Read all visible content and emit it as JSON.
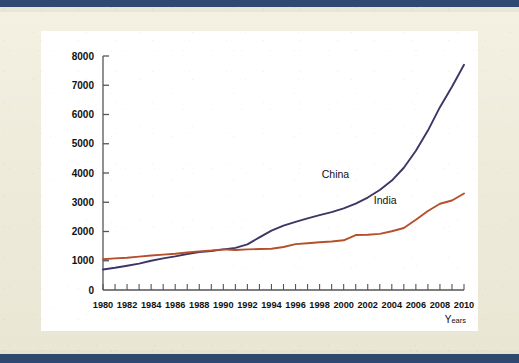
{
  "page": {
    "background_color": "#efebdb",
    "band_color": "#2e4a72",
    "card_color": "#ffffff"
  },
  "chart_data": {
    "type": "line",
    "title": "",
    "subtitle": "",
    "xlabel": "Years",
    "ylabel": "",
    "xlim": [
      1980,
      2010
    ],
    "ylim": [
      0,
      8000
    ],
    "grid": false,
    "legend": "inline-labels",
    "y_ticks": [
      0,
      1000,
      2000,
      3000,
      4000,
      5000,
      6000,
      7000,
      8000
    ],
    "y_tick_labels": [
      "0",
      "1000",
      "2000",
      "3000",
      "4000",
      "5000",
      "6000",
      "7000",
      "8000"
    ],
    "x_ticks": [
      1980,
      1981,
      1982,
      1983,
      1984,
      1985,
      1986,
      1987,
      1988,
      1989,
      1990,
      1991,
      1992,
      1993,
      1994,
      1995,
      1996,
      1997,
      1998,
      1999,
      2000,
      2001,
      2002,
      2003,
      2004,
      2005,
      2006,
      2007,
      2008,
      2009,
      2010
    ],
    "x_tick_labels": [
      "1980",
      "1982",
      "1984",
      "1986",
      "1988",
      "1990",
      "1992",
      "1994",
      "1996",
      "1998",
      "2000",
      "2002",
      "2004",
      "2006",
      "2008",
      "2010"
    ],
    "x_tick_label_step": 2,
    "x": [
      1980,
      1981,
      1982,
      1983,
      1984,
      1985,
      1986,
      1987,
      1988,
      1989,
      1990,
      1991,
      1992,
      1993,
      1994,
      1995,
      1996,
      1997,
      1998,
      1999,
      2000,
      2001,
      2002,
      2003,
      2004,
      2005,
      2006,
      2007,
      2008,
      2009,
      2010
    ],
    "series": [
      {
        "name": "China",
        "color": "#3e3564",
        "label_position": "above-line",
        "values": [
          700,
          760,
          830,
          900,
          1000,
          1080,
          1150,
          1230,
          1300,
          1330,
          1390,
          1440,
          1560,
          1800,
          2030,
          2200,
          2330,
          2450,
          2560,
          2660,
          2790,
          2950,
          3160,
          3420,
          3740,
          4180,
          4760,
          5450,
          6250,
          6950,
          7700
        ]
      },
      {
        "name": "India",
        "color": "#b5502a",
        "label_position": "above-line",
        "values": [
          1050,
          1080,
          1100,
          1140,
          1180,
          1210,
          1240,
          1280,
          1320,
          1350,
          1390,
          1370,
          1390,
          1400,
          1410,
          1470,
          1570,
          1600,
          1630,
          1660,
          1700,
          1880,
          1890,
          1920,
          2010,
          2120,
          2400,
          2700,
          2950,
          3060,
          3300
        ]
      }
    ]
  },
  "annotations": {
    "china_label": "China",
    "india_label": "India"
  },
  "axis": {
    "years_label_main": "Y",
    "years_label_rest": "ears"
  }
}
